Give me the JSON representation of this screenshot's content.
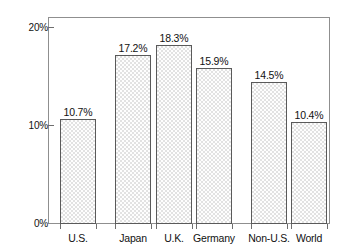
{
  "chart_data": {
    "type": "bar",
    "title": "",
    "subtitle": "",
    "xlabel": "",
    "ylabel": "",
    "categories": [
      "U.S.",
      "Japan",
      "U.K.",
      "Germany",
      "Non-U.S.",
      "World"
    ],
    "values": [
      10.7,
      17.2,
      18.3,
      15.9,
      14.5,
      10.4
    ],
    "value_labels": [
      "10.7%",
      "17.2%",
      "18.3%",
      "15.9%",
      "14.5%",
      "10.4%"
    ],
    "ylim": [
      0,
      20
    ],
    "ytick_values": [
      0,
      10,
      20
    ],
    "ytick_labels": [
      "0%",
      "10%",
      "20%"
    ],
    "grid": false,
    "legend": null,
    "bar_fill": "#e2e2e2",
    "bar_border": "#5a5a5a",
    "frame_color": "#8f8f8f",
    "text_color": "#111111",
    "annotations": []
  },
  "bars": [
    {
      "name": "U.S.",
      "label": "U.S.",
      "value_label": "10.7%",
      "left": 60,
      "width": 36
    },
    {
      "name": "Japan",
      "label": "Japan",
      "value_label": "17.2%",
      "left": 115,
      "width": 36
    },
    {
      "name": "U.K.",
      "label": "U.K.",
      "value_label": "18.3%",
      "left": 156,
      "width": 36
    },
    {
      "name": "Germany",
      "label": "Germany",
      "value_label": "15.9%",
      "left": 196,
      "width": 36
    },
    {
      "name": "Non-U.S.",
      "label": "Non-U.S.",
      "value_label": "14.5%",
      "left": 251,
      "width": 36
    },
    {
      "name": "World",
      "label": "World",
      "value_label": "10.4%",
      "left": 291,
      "width": 36
    }
  ],
  "yaxis": {
    "ticks": [
      {
        "label": "20%",
        "top": 23
      },
      {
        "label": "10%",
        "top": 121
      },
      {
        "label": "0%",
        "top": 219
      }
    ]
  }
}
